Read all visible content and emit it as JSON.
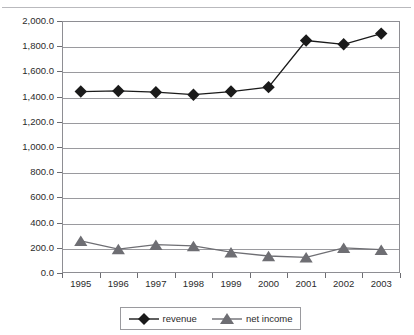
{
  "title": "",
  "chart_data": {
    "type": "line",
    "title": "",
    "xlabel": "",
    "ylabel": "",
    "categories": [
      "1995",
      "1996",
      "1997",
      "1998",
      "1999",
      "2000",
      "2001",
      "2002",
      "2003"
    ],
    "ylim": [
      0,
      2000
    ],
    "ytick_step": 200,
    "ytick_labels": [
      "0.0",
      "200.0",
      "400.0",
      "600.0",
      "800.0",
      "1,000.0",
      "1,200.0",
      "1,400.0",
      "1,600.0",
      "1,800.0",
      "2,000.0"
    ],
    "ytick_values": [
      0,
      200,
      400,
      600,
      800,
      1000,
      1200,
      1400,
      1600,
      1800,
      2000
    ],
    "grid": true,
    "legend_position": "bottom",
    "series": [
      {
        "name": "revenue",
        "marker": "diamond",
        "color": "#1a1a1a",
        "values": [
          1440,
          1445,
          1435,
          1415,
          1440,
          1475,
          1845,
          1815,
          1900
        ]
      },
      {
        "name": "net income",
        "marker": "triangle",
        "color": "#6e6e73",
        "values": [
          255,
          190,
          225,
          215,
          165,
          135,
          125,
          200,
          185
        ]
      }
    ]
  },
  "legend": {
    "items": [
      {
        "label": "revenue",
        "marker": "diamond",
        "color": "#1a1a1a"
      },
      {
        "label": "net income",
        "marker": "triangle",
        "color": "#6e6e73"
      }
    ]
  }
}
